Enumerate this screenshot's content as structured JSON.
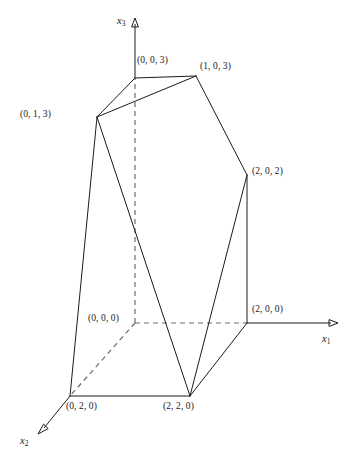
{
  "figure": {
    "background_color": "#ffffff",
    "line_color": "#1c1c1c",
    "hidden_line_color": "#6b6b6b"
  },
  "axes": [
    {
      "name": "x1",
      "label": "x",
      "subscript": "1",
      "direction": "right"
    },
    {
      "name": "x2",
      "label": "x",
      "subscript": "2",
      "direction": "down-left"
    },
    {
      "name": "x3",
      "label": "x",
      "subscript": "3",
      "direction": "up"
    }
  ],
  "vertices": [
    {
      "id": "v003",
      "label": "(0, 0, 3)",
      "coords": [
        0,
        0,
        3
      ],
      "px": [
        135,
        78
      ],
      "label_px": [
        137,
        56
      ]
    },
    {
      "id": "v103",
      "label": "(1, 0, 3)",
      "coords": [
        1,
        0,
        3
      ],
      "px": [
        196,
        76
      ],
      "label_px": [
        200,
        62
      ]
    },
    {
      "id": "v013",
      "label": "(0, 1, 3)",
      "coords": [
        0,
        1,
        3
      ],
      "px": [
        97,
        117
      ],
      "label_px": [
        20,
        110
      ]
    },
    {
      "id": "v202",
      "label": "(2, 0, 2)",
      "coords": [
        2,
        0,
        2
      ],
      "px": [
        247,
        175
      ],
      "label_px": [
        252,
        167
      ]
    },
    {
      "id": "v000",
      "label": "(0, 0, 0)",
      "coords": [
        0,
        0,
        0
      ],
      "px": [
        135,
        323
      ],
      "label_px": [
        88,
        314
      ]
    },
    {
      "id": "v200",
      "label": "(2, 0, 0)",
      "coords": [
        2,
        0,
        0
      ],
      "px": [
        247,
        323
      ],
      "label_px": [
        252,
        305
      ]
    },
    {
      "id": "v020",
      "label": "(0, 2, 0)",
      "coords": [
        0,
        2,
        0
      ],
      "px": [
        70,
        396
      ],
      "label_px": [
        66,
        402
      ]
    },
    {
      "id": "v220",
      "label": "(2, 2, 0)",
      "coords": [
        2,
        2,
        0
      ],
      "px": [
        190,
        396
      ],
      "label_px": [
        163,
        402
      ]
    }
  ],
  "axis_labels": [
    {
      "id": "x3",
      "text": "x",
      "sub": "3",
      "px": [
        117,
        16
      ]
    },
    {
      "id": "x1",
      "text": "x",
      "sub": "1",
      "px": [
        322,
        334
      ]
    },
    {
      "id": "x2",
      "text": "x",
      "sub": "2",
      "px": [
        20,
        436
      ]
    }
  ],
  "edges": [
    {
      "from": "(0, 0, 3)",
      "to": "(1, 0, 3)",
      "style": "solid"
    },
    {
      "from": "(0, 0, 3)",
      "to": "(0, 1, 3)",
      "style": "solid"
    },
    {
      "from": "(1, 0, 3)",
      "to": "(0, 1, 3)",
      "style": "solid"
    },
    {
      "from": "(1, 0, 3)",
      "to": "(2, 0, 2)",
      "style": "solid"
    },
    {
      "from": "(0, 1, 3)",
      "to": "(0, 2, 0)",
      "style": "solid"
    },
    {
      "from": "(0, 1, 3)",
      "to": "(2, 2, 0)",
      "style": "solid"
    },
    {
      "from": "(2, 0, 2)",
      "to": "(2, 0, 0)",
      "style": "solid"
    },
    {
      "from": "(2, 0, 2)",
      "to": "(2, 2, 0)",
      "style": "solid"
    },
    {
      "from": "(0, 2, 0)",
      "to": "(2, 2, 0)",
      "style": "solid"
    },
    {
      "from": "(2, 2, 0)",
      "to": "(2, 0, 0)",
      "style": "solid"
    },
    {
      "from": "(0, 0, 0)",
      "to": "(2, 0, 0)",
      "style": "dashed"
    },
    {
      "from": "(0, 0, 0)",
      "to": "(0, 0, 3)",
      "style": "dashed"
    },
    {
      "from": "(0, 0, 0)",
      "to": "(0, 2, 0)",
      "style": "dashed"
    }
  ]
}
